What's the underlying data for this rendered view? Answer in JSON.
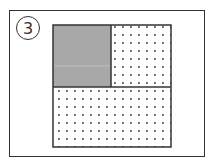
{
  "figure": {
    "number_label": "3",
    "colors": {
      "shaded": "#a8a8a8",
      "dots": "#333333",
      "border": "#333333",
      "background": "#ffffff"
    },
    "regions": [
      {
        "name": "top-left",
        "fill": "shaded"
      },
      {
        "name": "top-right",
        "fill": "dotted"
      },
      {
        "name": "bottom",
        "fill": "dotted"
      }
    ]
  }
}
